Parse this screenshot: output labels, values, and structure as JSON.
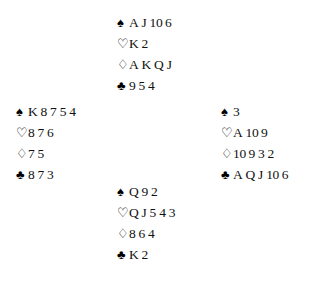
{
  "diagram": {
    "type": "bridge-deal-layout",
    "suit_symbols": {
      "spade": "♠",
      "heart": "♡",
      "diamond": "♢",
      "club": "♣"
    },
    "suit_order": [
      "spade",
      "heart",
      "diamond",
      "club"
    ],
    "colors": {
      "background": "#ffffff",
      "text": "#111111",
      "symbol": "#000000"
    },
    "hands": {
      "north": {
        "position": "north",
        "suits": {
          "spade": {
            "symbol": "♠",
            "ranks": [
              "A",
              "J",
              "10",
              "6"
            ]
          },
          "heart": {
            "symbol": "♡",
            "ranks": [
              "K",
              "2"
            ]
          },
          "diamond": {
            "symbol": "♢",
            "ranks": [
              "A",
              "K",
              "Q",
              "J"
            ]
          },
          "club": {
            "symbol": "♣",
            "ranks": [
              "9",
              "5",
              "4"
            ]
          }
        }
      },
      "west": {
        "position": "west",
        "suits": {
          "spade": {
            "symbol": "♠",
            "ranks": [
              "K",
              "8",
              "7",
              "5",
              "4"
            ]
          },
          "heart": {
            "symbol": "♡",
            "ranks": [
              "8",
              "7",
              "6"
            ]
          },
          "diamond": {
            "symbol": "♢",
            "ranks": [
              "7",
              "5"
            ]
          },
          "club": {
            "symbol": "♣",
            "ranks": [
              "8",
              "7",
              "3"
            ]
          }
        }
      },
      "east": {
        "position": "east",
        "suits": {
          "spade": {
            "symbol": "♠",
            "ranks": [
              "3"
            ]
          },
          "heart": {
            "symbol": "♡",
            "ranks": [
              "A",
              "10",
              "9"
            ]
          },
          "diamond": {
            "symbol": "♢",
            "ranks": [
              "10",
              "9",
              "3",
              "2"
            ]
          },
          "club": {
            "symbol": "♣",
            "ranks": [
              "A",
              "Q",
              "J",
              "10",
              "6"
            ]
          }
        }
      },
      "south": {
        "position": "south",
        "suits": {
          "spade": {
            "symbol": "♠",
            "ranks": [
              "Q",
              "9",
              "2"
            ]
          },
          "heart": {
            "symbol": "♡",
            "ranks": [
              "Q",
              "J",
              "5",
              "4",
              "3"
            ]
          },
          "diamond": {
            "symbol": "♢",
            "ranks": [
              "8",
              "6",
              "4"
            ]
          },
          "club": {
            "symbol": "♣",
            "ranks": [
              "K",
              "2"
            ]
          }
        }
      }
    }
  }
}
